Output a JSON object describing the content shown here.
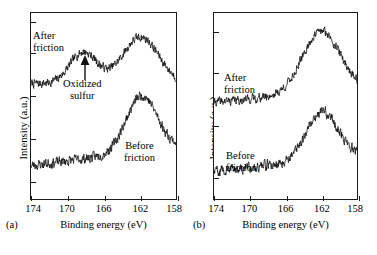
{
  "figure": {
    "axis_title": "Binding energy (eV)",
    "y_axis_title": "Intensity (a.u.)"
  },
  "panels": [
    {
      "caption": "(a)",
      "annotations": {
        "after": "After\nfriction",
        "before": "Before\nfriction",
        "oxidized": "Oxidized\nsulfur"
      }
    },
    {
      "caption": "(b)",
      "annotations": {
        "after": "After\nfriction",
        "before": "Before\nfriction"
      }
    }
  ],
  "chart_data": [
    {
      "type": "line",
      "title": "(a) S 2p XPS spectra",
      "xlabel": "Binding energy (eV)",
      "ylabel": "Intensity (a.u.)",
      "xlim": [
        174,
        158
      ],
      "x_reversed": true,
      "xticks": [
        174,
        170,
        166,
        162,
        158
      ],
      "ylim": [
        0,
        1
      ],
      "y_ticks_labeled": false,
      "y_tick_positions": [
        0.1,
        0.33,
        0.56,
        0.79,
        0.95
      ],
      "grid": false,
      "legend": "inline-annotations",
      "annotations": [
        {
          "text": "After friction",
          "x": 173.2,
          "y": 0.8
        },
        {
          "text": "Oxidized sulfur",
          "x": 169.6,
          "y": 0.53
        },
        {
          "text": "Before friction",
          "x": 163.2,
          "y": 0.26
        },
        {
          "text": "arrow",
          "x": 168.2,
          "y": 0.62,
          "type": "up-arrow"
        }
      ],
      "series": [
        {
          "name": "After friction",
          "baseline": 0.62,
          "peaks": [
            {
              "center": 168.2,
              "height": 0.17,
              "width": 1.5,
              "label": "oxidized sulfur"
            },
            {
              "center": 161.9,
              "height": 0.25,
              "width": 2.0,
              "label": "sulfide S 2p"
            }
          ],
          "noise": 0.035
        },
        {
          "name": "Before friction",
          "baseline": 0.18,
          "peaks": [
            {
              "center": 161.8,
              "height": 0.3,
              "width": 1.7,
              "label": "sulfide S 2p"
            }
          ],
          "rise": 0.1,
          "noise": 0.04
        }
      ]
    },
    {
      "type": "line",
      "title": "(b) S 2p XPS spectra",
      "xlabel": "Binding energy (eV)",
      "ylabel": "Intensity (a.u.)",
      "xlim": [
        174,
        158
      ],
      "x_reversed": true,
      "xticks": [
        174,
        170,
        166,
        162,
        158
      ],
      "ylim": [
        0,
        1
      ],
      "y_ticks_labeled": false,
      "y_tick_positions": [
        0.12,
        0.4,
        0.68,
        0.9
      ],
      "grid": false,
      "legend": "inline-annotations",
      "annotations": [
        {
          "text": "After friction",
          "x": 172.6,
          "y": 0.57
        },
        {
          "text": "Before friction",
          "x": 172.4,
          "y": 0.15
        }
      ],
      "series": [
        {
          "name": "After friction",
          "baseline": 0.52,
          "peaks": [
            {
              "center": 162.0,
              "height": 0.33,
              "width": 2.1,
              "label": "sulfide S 2p"
            }
          ],
          "rise": 0.07,
          "noise": 0.035
        },
        {
          "name": "Before friction",
          "baseline": 0.15,
          "peaks": [
            {
              "center": 161.9,
              "height": 0.26,
              "width": 1.8,
              "label": "sulfide S 2p"
            }
          ],
          "rise": 0.08,
          "noise": 0.04
        }
      ]
    }
  ]
}
